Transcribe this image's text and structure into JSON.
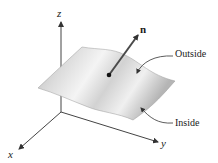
{
  "figure": {
    "axes": {
      "x_label": "x",
      "y_label": "y",
      "z_label": "z"
    },
    "normal_vector_label": "n",
    "annotations": {
      "outside": "Outside",
      "inside": "Inside"
    },
    "colors": {
      "axis": "#333333",
      "surface_light": "#f2f2f2",
      "surface_dark": "#a8a8a8",
      "vector": "#444444",
      "text": "#1a1a1a"
    }
  }
}
